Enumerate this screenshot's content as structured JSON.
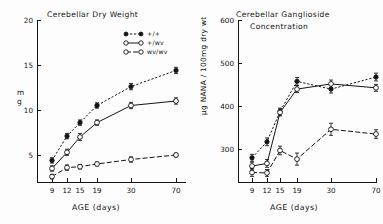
{
  "figure": {
    "xlabel": "AGE (days)",
    "xticks": [
      "9",
      "12",
      "15",
      "19",
      "30",
      "70"
    ],
    "legend": [
      {
        "label": "+/+",
        "marker": "filled-circle",
        "dash": "dotted"
      },
      {
        "label": "+/wv",
        "marker": "open-circle",
        "dash": "solid"
      },
      {
        "label": "wv/wv",
        "marker": "open-circle",
        "dash": "dash-dot"
      }
    ]
  },
  "chart_data": [
    {
      "type": "line",
      "title": "Cerebellar Dry Weight",
      "title_line2": "",
      "xlabel": "AGE (days)",
      "ylabel": "mg",
      "x": [
        9,
        12,
        15,
        19,
        30,
        70
      ],
      "xtick_labels": [
        "9",
        "12",
        "15",
        "19",
        "30",
        "70"
      ],
      "yticks": [
        5,
        10,
        15,
        20
      ],
      "ylim": [
        2,
        20
      ],
      "grid": false,
      "legend_position": "top-right",
      "series": [
        {
          "name": "+/+",
          "marker": "filled-circle",
          "dash": "dotted",
          "values": [
            4.4,
            7.1,
            8.6,
            10.5,
            12.6,
            14.4
          ],
          "errors": [
            0.3,
            0.3,
            0.3,
            0.3,
            0.35,
            0.35
          ]
        },
        {
          "name": "+/wv",
          "marker": "open-circle",
          "dash": "solid",
          "values": [
            3.5,
            5.3,
            7.0,
            8.6,
            10.5,
            11.0
          ],
          "errors": [
            0.3,
            0.35,
            0.4,
            0.3,
            0.35,
            0.35
          ]
        },
        {
          "name": "wv/wv",
          "marker": "open-circle",
          "dash": "dash-dot",
          "values": [
            2.6,
            3.6,
            3.7,
            4.0,
            4.5,
            5.0
          ],
          "errors": [
            0.25,
            0.3,
            0.25,
            0.2,
            0.3,
            0.2
          ]
        }
      ]
    },
    {
      "type": "line",
      "title": "Cerebellar Ganglioside",
      "title_line2": "Concentration",
      "xlabel": "AGE (days)",
      "ylabel": "µg NANA / 100mg dry wt",
      "x": [
        9,
        12,
        15,
        19,
        30,
        70
      ],
      "xtick_labels": [
        "9",
        "12",
        "15",
        "19",
        "30",
        "70"
      ],
      "yticks": [
        300,
        400,
        500,
        600
      ],
      "ylim": [
        225,
        600
      ],
      "grid": false,
      "legend_position": "none",
      "series": [
        {
          "name": "+/+",
          "marker": "filled-circle",
          "dash": "dotted",
          "values": [
            281,
            318,
            388,
            458,
            440,
            468
          ],
          "errors": [
            8,
            9,
            8,
            9,
            9,
            9
          ]
        },
        {
          "name": "+/wv",
          "marker": "open-circle",
          "dash": "solid",
          "values": [
            262,
            268,
            386,
            440,
            452,
            443
          ],
          "errors": [
            9,
            9,
            8,
            8,
            9,
            8
          ]
        },
        {
          "name": "wv/wv",
          "marker": "open-circle",
          "dash": "dash-dot",
          "values": [
            247,
            246,
            298,
            278,
            347,
            336
          ],
          "errors": [
            9,
            8,
            10,
            14,
            14,
            10
          ]
        }
      ]
    }
  ]
}
